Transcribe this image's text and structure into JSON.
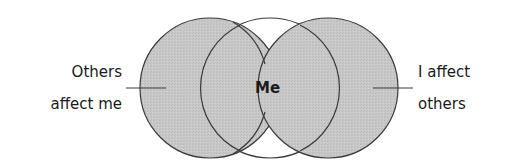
{
  "diagram": {
    "type": "venn",
    "colors": {
      "shaded_fill": "#c6c6c6",
      "center_fill": "#ffffff",
      "stroke": "#3a3a3a",
      "text": "#1a1a1a"
    },
    "center_label": "Me",
    "left_label": {
      "line1": "Others",
      "line2": "affect me"
    },
    "right_label": {
      "line1": "I affect",
      "line2": "others"
    }
  }
}
